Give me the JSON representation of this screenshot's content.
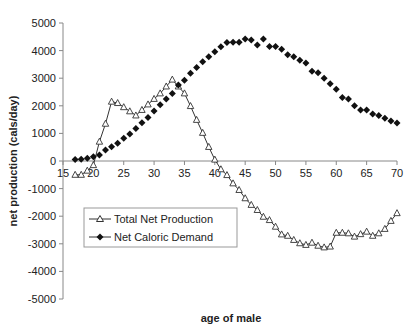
{
  "chart_data": {
    "type": "line",
    "title": "",
    "xlabel": "age of male",
    "ylabel": "net production (cals/day)",
    "xlim": [
      15,
      70
    ],
    "ylim": [
      -5000,
      5000
    ],
    "x_ticks": [
      15,
      20,
      25,
      30,
      35,
      40,
      45,
      50,
      55,
      60,
      65,
      70
    ],
    "y_ticks": [
      5000,
      4000,
      3000,
      2000,
      1000,
      0,
      -1000,
      -2000,
      -3000,
      -4000,
      -5000
    ],
    "grid": false,
    "legend_position": "lower left inside plot",
    "series": [
      {
        "name": "Total Net Production",
        "marker": "triangle-open",
        "color": "#333333",
        "x": [
          17,
          18,
          19,
          20,
          21,
          22,
          23,
          24,
          25,
          26,
          27,
          28,
          29,
          30,
          31,
          32,
          33,
          34,
          35,
          36,
          37,
          38,
          39,
          40,
          41,
          42,
          43,
          44,
          45,
          46,
          47,
          48,
          49,
          50,
          51,
          52,
          53,
          54,
          55,
          56,
          57,
          58,
          59,
          60,
          61,
          62,
          63,
          64,
          65,
          66,
          67,
          68,
          69,
          70
        ],
        "values": [
          -500,
          -500,
          -350,
          -150,
          700,
          1350,
          2150,
          2100,
          1950,
          1800,
          1650,
          1850,
          2050,
          2250,
          2450,
          2700,
          2950,
          2700,
          2450,
          1990,
          1490,
          1020,
          510,
          50,
          -300,
          -510,
          -810,
          -1050,
          -1350,
          -1590,
          -1775,
          -2020,
          -2140,
          -2380,
          -2660,
          -2710,
          -2860,
          -2980,
          -3040,
          -2960,
          -3070,
          -3130,
          -3100,
          -2600,
          -2600,
          -2620,
          -2740,
          -2650,
          -2560,
          -2710,
          -2620,
          -2460,
          -2170,
          -1890
        ]
      },
      {
        "name": "Net Caloric Demand",
        "marker": "diamond-filled",
        "color": "#111111",
        "x": [
          17,
          18,
          19,
          20,
          21,
          22,
          23,
          24,
          25,
          26,
          27,
          28,
          29,
          30,
          31,
          32,
          33,
          34,
          35,
          36,
          37,
          38,
          39,
          40,
          41,
          42,
          43,
          44,
          45,
          46,
          47,
          48,
          49,
          50,
          51,
          52,
          53,
          54,
          55,
          56,
          57,
          58,
          59,
          60,
          61,
          62,
          63,
          64,
          65,
          66,
          67,
          68,
          69,
          70
        ],
        "values": [
          50,
          60,
          100,
          150,
          217,
          400,
          520,
          640,
          820,
          980,
          1180,
          1390,
          1580,
          1810,
          2040,
          2250,
          2450,
          2750,
          2930,
          3180,
          3390,
          3600,
          3780,
          3960,
          4140,
          4290,
          4300,
          4300,
          4420,
          4380,
          4200,
          4420,
          4150,
          4150,
          4050,
          3850,
          3780,
          3650,
          3550,
          3250,
          3200,
          3000,
          2800,
          2600,
          2300,
          2250,
          2000,
          1850,
          1850,
          1700,
          1650,
          1550,
          1450,
          1380
        ]
      }
    ]
  },
  "legend": {
    "items": [
      {
        "label": "Total Net Production"
      },
      {
        "label": "Net Caloric Demand"
      }
    ]
  }
}
